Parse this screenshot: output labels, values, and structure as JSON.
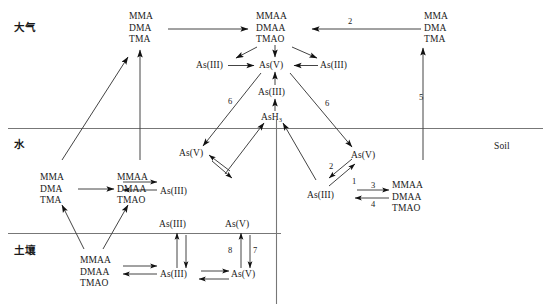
{
  "figure": {
    "compartments": [
      {
        "id": "atmosphere",
        "label": "大气"
      },
      {
        "id": "water",
        "label": "水"
      },
      {
        "id": "soil",
        "label": "土壤"
      }
    ],
    "side_label": "Soil"
  },
  "nodes": {
    "atm_left_methyl": {
      "l1": "MMA",
      "l2": "DMA",
      "l3": "TMA"
    },
    "atm_center_methyl": {
      "l1": "MMAA",
      "l2": "DMAA",
      "l3": "TMAO"
    },
    "atm_right_methyl": {
      "l1": "MMA",
      "l2": "DMA",
      "l3": "TMA"
    },
    "atm_as3_left": {
      "label": "As(III)"
    },
    "atm_as5_center": {
      "label": "As(V)"
    },
    "atm_as3_right": {
      "label": "As(III)"
    },
    "atm_as3_lower": {
      "label": "As(III)"
    },
    "ash3": {
      "label": "AsH",
      "sub": "3"
    },
    "water_as5_left": {
      "label": "As(V)"
    },
    "water_as3_left": {
      "label": "As(III)"
    },
    "water_methyl_left": {
      "l1": "MMA",
      "l2": "DMA",
      "l3": "TMA"
    },
    "water_methyl_center": {
      "l1": "MMAA",
      "l2": "DMAA",
      "l3": "TMAO"
    },
    "water_as5_right": {
      "label": "As(V)"
    },
    "water_as3_right": {
      "label": "As(III)"
    },
    "water_methyl_right": {
      "l1": "MMAA",
      "l2": "DMAA",
      "l3": "TMAO"
    },
    "soil_interface_as3": {
      "label": "As(III)"
    },
    "soil_interface_as5": {
      "label": "As(V)"
    },
    "soil_methyl": {
      "l1": "MMAA",
      "l2": "DMAA",
      "l3": "TMAO"
    },
    "soil_as3": {
      "label": "As(III)"
    },
    "soil_as5": {
      "label": "As(V)"
    }
  },
  "edge_labels": {
    "n1": "1",
    "n2_top": "2",
    "n2_right": "2",
    "n3": "3",
    "n4": "4",
    "n5": "5",
    "n6_left": "6",
    "n6_right": "6",
    "n7": "7",
    "n8": "8"
  },
  "colors": {
    "line": "#555555",
    "arrow": "#111111",
    "text": "#1a1a1a"
  }
}
